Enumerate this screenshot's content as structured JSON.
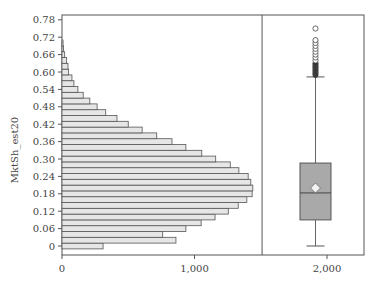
{
  "chart_data": {
    "type": "bar",
    "subtype": "horizontal-histogram-with-boxplot",
    "title": "",
    "ylabel": "MktSh_est20",
    "xlabel": "",
    "ylim": [
      -0.02,
      0.82
    ],
    "xlim": [
      0,
      2300
    ],
    "y_ticks": [
      "0",
      "0.06",
      "0.12",
      "0.18",
      "0.24",
      "0.30",
      "0.36",
      "0.42",
      "0.48",
      "0.54",
      "0.60",
      "0.66",
      "0.72",
      "0.78"
    ],
    "x_ticks": [
      "0",
      "1,000",
      "2,000"
    ],
    "grid": false,
    "bin_width": 0.02,
    "histogram": {
      "bins": [
        0,
        0.02,
        0.04,
        0.06,
        0.08,
        0.1,
        0.12,
        0.14,
        0.16,
        0.18,
        0.2,
        0.22,
        0.24,
        0.26,
        0.28,
        0.3,
        0.32,
        0.34,
        0.36,
        0.38,
        0.4,
        0.42,
        0.44,
        0.46,
        0.48,
        0.5,
        0.52,
        0.54,
        0.56,
        0.58,
        0.6,
        0.62,
        0.64,
        0.66,
        0.68,
        0.7
      ],
      "counts": [
        310,
        860,
        760,
        935,
        1050,
        1155,
        1255,
        1330,
        1395,
        1435,
        1440,
        1425,
        1405,
        1335,
        1270,
        1160,
        1055,
        935,
        830,
        715,
        605,
        500,
        415,
        330,
        265,
        210,
        160,
        120,
        90,
        75,
        50,
        45,
        35,
        20,
        12,
        8
      ]
    },
    "boxplot": {
      "x_position": 1920,
      "min_whisker": 0.0,
      "q1": 0.09,
      "median": 0.183,
      "mean": 0.2,
      "q3": 0.286,
      "max_whisker": 0.583,
      "outliers": [
        0.59,
        0.595,
        0.6,
        0.605,
        0.61,
        0.615,
        0.62,
        0.625,
        0.63,
        0.64,
        0.65,
        0.66,
        0.67,
        0.68,
        0.69,
        0.7,
        0.71,
        0.75
      ]
    },
    "panel_divider_x": 1510
  }
}
